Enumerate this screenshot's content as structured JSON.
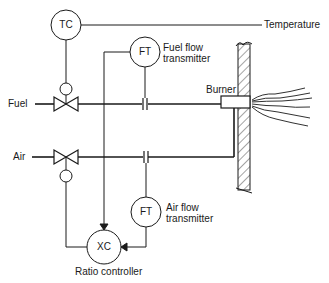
{
  "diagram": {
    "type": "process control schematic",
    "instruments": [
      {
        "tag": "TC",
        "name": "Temperature controller",
        "label": ""
      },
      {
        "tag": "FT",
        "name": "Fuel flow transmitter",
        "label_line1": "Fuel flow",
        "label_line2": "transmitter"
      },
      {
        "tag": "FT",
        "name": "Air flow transmitter",
        "label_line1": "Air flow",
        "label_line2": "transmitter"
      },
      {
        "tag": "XC",
        "name": "Ratio controller",
        "label": "Ratio controller"
      }
    ],
    "lines": {
      "fuel": "Fuel",
      "air": "Air",
      "temperature": "Temperature"
    },
    "equipment": {
      "burner": "Burner"
    },
    "colors": {
      "ink": "#1a1a1a",
      "background": "#ffffff"
    }
  }
}
